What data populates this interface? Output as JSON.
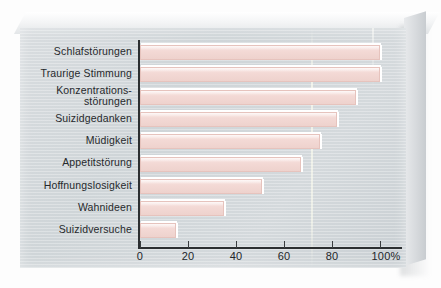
{
  "chart_data": {
    "type": "bar",
    "orientation": "horizontal",
    "title": "",
    "subtitle": "",
    "xlabel": "",
    "ylabel": "",
    "xlim": [
      0,
      100
    ],
    "grid": false,
    "legend": null,
    "unit": "%",
    "axis": {
      "ticks": [
        0,
        20,
        40,
        60,
        80,
        100
      ],
      "tick_labels": [
        "0",
        "20",
        "40",
        "60",
        "80",
        "100%"
      ]
    },
    "categories": [
      "Schlafstörungen",
      "Traurige Stimmung",
      "Konzentrations-\nstörungen",
      "Suizidgedanken",
      "Müdigkeit",
      "Appetitstörung",
      "Hoffnungslosigkeit",
      "Wahnideen",
      "Suizidversuche"
    ],
    "values": [
      100,
      100,
      90,
      82,
      75,
      67,
      51,
      35,
      15
    ],
    "colors": {
      "bar_fill": "#f3d9d5",
      "bar_border": "#e6c3bd",
      "bar_highlight": "#ffffff",
      "axis": "#2c2f31",
      "text": "#26292c",
      "card_background": "#d4d9dc",
      "page_background": "#fdfdfd"
    }
  }
}
